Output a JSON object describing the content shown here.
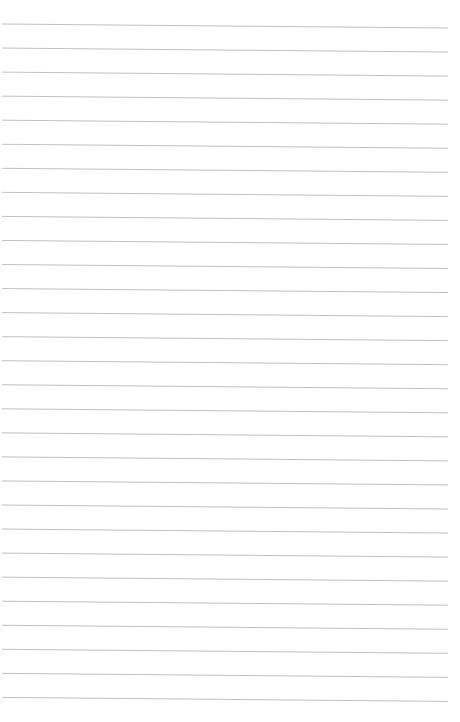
{
  "document": {
    "type": "lined-paper",
    "text": "",
    "line_count": 29,
    "line_color": "#b9b9b9",
    "background_color": "#ffffff"
  }
}
